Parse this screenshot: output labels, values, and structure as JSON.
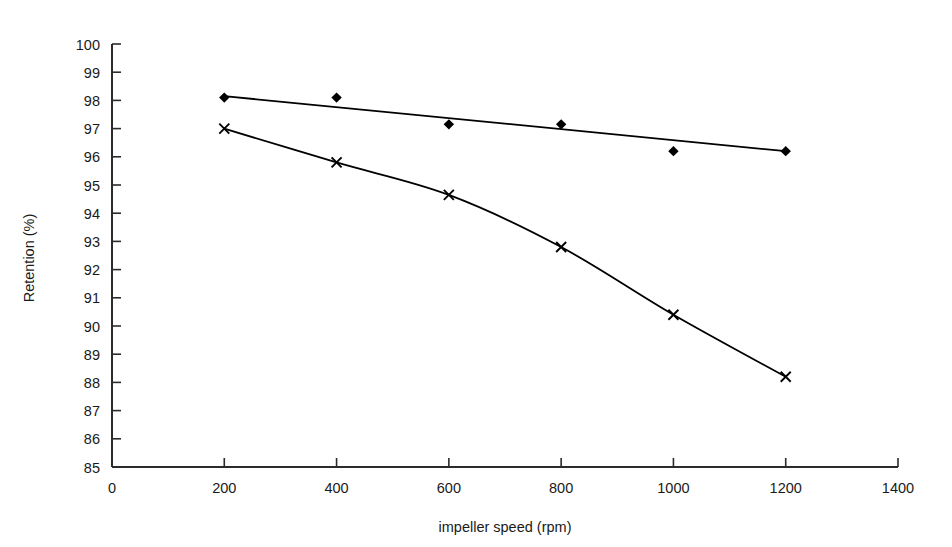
{
  "chart_data": {
    "type": "line",
    "title": "",
    "xlabel": "impeller speed (rpm)",
    "ylabel": "Retention (%)",
    "xlim": [
      0,
      1400
    ],
    "ylim": [
      85,
      100
    ],
    "xticks": [
      0,
      200,
      400,
      600,
      800,
      1000,
      1200,
      1400
    ],
    "yticks": [
      85,
      86,
      87,
      88,
      89,
      90,
      91,
      92,
      93,
      94,
      95,
      96,
      97,
      98,
      99,
      100
    ],
    "grid": false,
    "legend": "none",
    "series": [
      {
        "name": "series-diamond",
        "marker": "diamond",
        "color": "#000000",
        "x": [
          200,
          400,
          600,
          800,
          1000,
          1200
        ],
        "values": [
          98.1,
          98.1,
          97.15,
          97.15,
          96.2,
          96.2
        ],
        "fit": {
          "type": "linear",
          "x": [
            200,
            1200
          ],
          "y": [
            98.15,
            96.2
          ]
        }
      },
      {
        "name": "series-cross",
        "marker": "x",
        "color": "#000000",
        "x": [
          200,
          400,
          600,
          800,
          1000,
          1200
        ],
        "values": [
          97.0,
          95.8,
          94.65,
          92.8,
          90.4,
          88.2
        ],
        "fit": {
          "type": "smooth"
        }
      }
    ]
  },
  "axes": {
    "y_label": "Retention (%)",
    "x_label": "impeller speed (rpm)",
    "y_tick_labels": [
      "100",
      "99",
      "98",
      "97",
      "96",
      "95",
      "94",
      "93",
      "92",
      "91",
      "90",
      "89",
      "88",
      "87",
      "86",
      "85"
    ],
    "x_tick_labels": [
      "0",
      "200",
      "400",
      "600",
      "800",
      "1000",
      "1200",
      "1400"
    ]
  }
}
